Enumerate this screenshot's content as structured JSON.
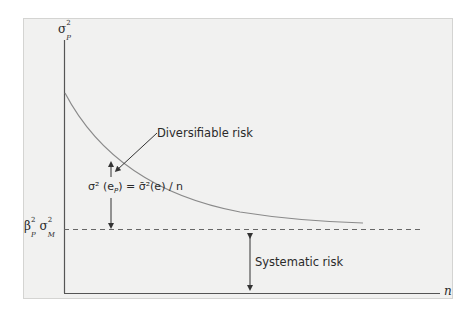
{
  "figure": {
    "type": "portfolio-risk-diversification-diagram",
    "y_axis_label": "σ²P",
    "y_axis_label_parts": {
      "base": "σ",
      "sup": "2",
      "sub": "P"
    },
    "x_axis_label": "n",
    "systematic_level_label_parts": {
      "beta": "β",
      "beta_sup": "2",
      "beta_sub": "P",
      "sigma": "σ",
      "sigma_sup": "2",
      "sigma_sub": "M"
    },
    "annotations": {
      "diversifiable": "Diversifiable risk",
      "formula": "σ² (eP) = σ̄²(e) / n",
      "formula_parts": {
        "left": "σ² (e",
        "left_sub": "P",
        "mid": ") = ",
        "right": "σ̄²(e) / n"
      },
      "systematic": "Systematic risk"
    },
    "colors": {
      "panel_bg": "#f1f1f0",
      "axis": "#555555",
      "curve": "#8a8a8a",
      "dashed": "#6a6a6a",
      "text": "#2a2a2a"
    }
  }
}
